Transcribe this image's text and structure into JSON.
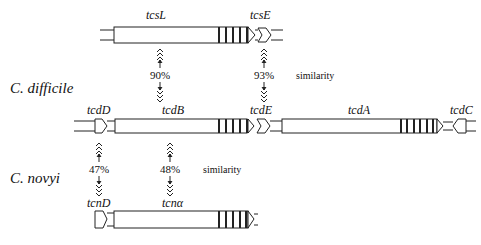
{
  "organisms": {
    "c_difficile": "C. difficile",
    "c_novyi": "C. novyi"
  },
  "genes": {
    "top_row": {
      "tcsL": "tcsL",
      "tcsE": "tcsE"
    },
    "middle_row": {
      "tcdD": "tcdD",
      "tcdB": "tcdB",
      "tcdE": "tcdE",
      "tcdA": "tcdA",
      "tcdC": "tcdC"
    },
    "bottom_row": {
      "tcnD": "tcnD",
      "tcnA": "tcnα"
    }
  },
  "similarities": {
    "tcsL_tcdB": "90%",
    "tcsE_tcdE": "93%",
    "tcdD_tcnD": "47%",
    "tcdB_tcnA": "48%",
    "label": "similarity"
  },
  "colors": {
    "line": "#222222",
    "fill": "#ffffff",
    "stripe": "#222222"
  }
}
